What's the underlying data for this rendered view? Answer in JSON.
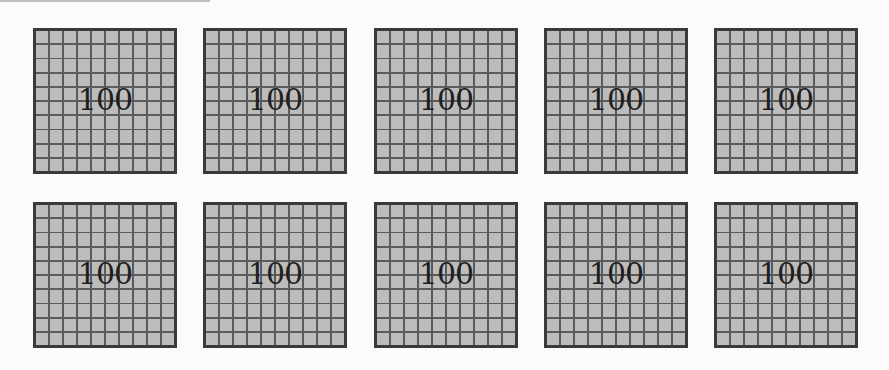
{
  "grid": {
    "rows": 2,
    "columns": 5,
    "cells_per_square": "10x10",
    "squares": [
      {
        "label": "100"
      },
      {
        "label": "100"
      },
      {
        "label": "100"
      },
      {
        "label": "100"
      },
      {
        "label": "100"
      },
      {
        "label": "100"
      },
      {
        "label": "100"
      },
      {
        "label": "100"
      },
      {
        "label": "100"
      },
      {
        "label": "100"
      }
    ]
  },
  "colors": {
    "background": "#fbfbfa",
    "cell_fill": "#bcbcbc",
    "grid_line": "#5a5a5a",
    "border": "#3a3a3a",
    "text": "#1f1f1f"
  }
}
